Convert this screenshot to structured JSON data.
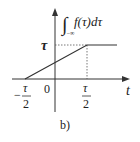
{
  "figure": {
    "caption": "b)",
    "y_label": {
      "integral": "∫",
      "lower_limit": "−∞",
      "integrand": "f(τ)dτ"
    },
    "x_axis_label": "t",
    "origin_label": "0",
    "y_tick_label": "τ",
    "x_ticks": [
      {
        "sign": "−",
        "numerator": "τ",
        "denominator": "2"
      },
      {
        "sign": "",
        "numerator": "τ",
        "denominator": "2"
      }
    ],
    "curve": {
      "description": "ramp from −τ/2 to τ/2 rising to τ, then constant τ",
      "points": [
        [
          -0.5,
          0
        ],
        [
          0.5,
          1
        ],
        [
          1.0,
          1
        ]
      ]
    }
  }
}
